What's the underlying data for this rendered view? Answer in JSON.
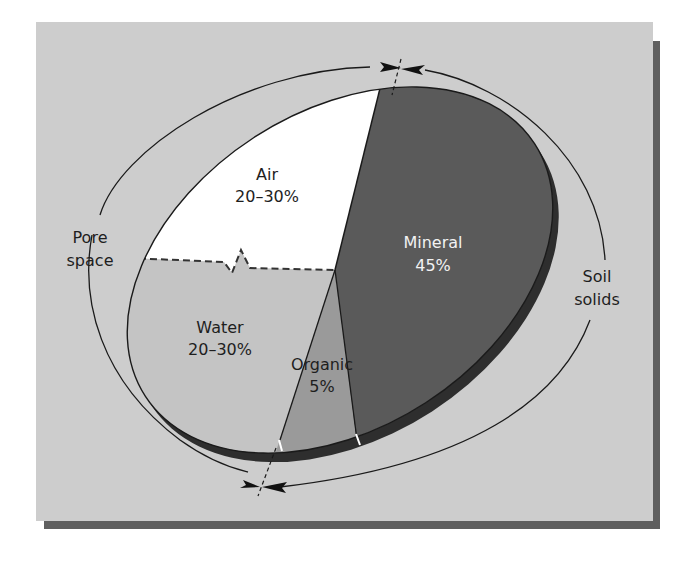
{
  "figure": {
    "type": "soil-composition-pie",
    "colors": {
      "panel_bg": "#cdcdcd",
      "panel_shadow": "#5f5f5f",
      "air": "#ffffff",
      "water": "#c4c4c4",
      "organic": "#9a9a9a",
      "mineral": "#5a5a5a",
      "rim": "#2e2e2e",
      "outline": "#1a1a1a"
    },
    "slices": [
      {
        "name": "Air",
        "value_label": "20–30%"
      },
      {
        "name": "Water",
        "value_label": "20–30%"
      },
      {
        "name": "Organic",
        "value_label": "5%"
      },
      {
        "name": "Mineral",
        "value_label": "45%"
      }
    ],
    "groups": [
      {
        "name_line1": "Pore",
        "name_line2": "space",
        "covers": [
          "Air",
          "Water"
        ]
      },
      {
        "name_line1": "Soil",
        "name_line2": "solids",
        "covers": [
          "Organic",
          "Mineral"
        ]
      }
    ]
  }
}
